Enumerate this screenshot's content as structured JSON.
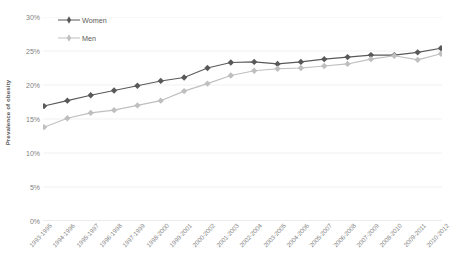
{
  "chart_data": {
    "type": "line",
    "title": "",
    "xlabel": "",
    "ylabel": "Prevalence of obesity",
    "ylim": [
      0,
      30
    ],
    "y_ticks": [
      30,
      25,
      20,
      15,
      10,
      5,
      0
    ],
    "y_tick_labels": [
      "30%",
      "25%",
      "20%",
      "15%",
      "10%",
      "5%",
      "0%"
    ],
    "grid": true,
    "legend_position": "top-left",
    "categories": [
      "1993-1995",
      "1994-1996",
      "1995-1997",
      "1996-1998",
      "1997-1999",
      "1998-2000",
      "1999-2001",
      "2000-2002",
      "2001-2003",
      "2002-2004",
      "2003-2005",
      "2004-2006",
      "2005-2007",
      "2006-2008",
      "2007-2009",
      "2008-2010",
      "2009-2011",
      "2010-2012"
    ],
    "series": [
      {
        "name": "Women",
        "color": "#595959",
        "marker": "diamond",
        "values": [
          16.9,
          17.7,
          18.5,
          19.2,
          19.9,
          20.6,
          21.1,
          22.5,
          23.3,
          23.4,
          23.1,
          23.4,
          23.8,
          24.1,
          24.4,
          24.4,
          24.8,
          25.4
        ]
      },
      {
        "name": "Men",
        "color": "#bfbfbf",
        "marker": "diamond",
        "values": [
          13.8,
          15.1,
          15.9,
          16.3,
          17.0,
          17.7,
          19.1,
          20.2,
          21.4,
          22.1,
          22.4,
          22.5,
          22.8,
          23.1,
          23.8,
          24.3,
          23.7,
          24.6
        ]
      }
    ]
  },
  "legend": {
    "items": [
      {
        "label": "Women"
      },
      {
        "label": "Men"
      }
    ]
  }
}
